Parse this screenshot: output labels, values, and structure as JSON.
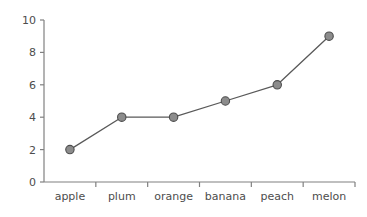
{
  "chart_data": {
    "type": "line",
    "title": "",
    "subtitle": "",
    "xlabel": "",
    "ylabel": "",
    "categories": [
      "apple",
      "plum",
      "orange",
      "banana",
      "peach",
      "melon"
    ],
    "values": [
      2,
      4,
      4,
      5,
      6,
      9
    ],
    "series": [
      {
        "name": "",
        "values": [
          2,
          4,
          4,
          5,
          6,
          9
        ]
      }
    ],
    "ylim": [
      0,
      10
    ],
    "ytick_labels": [
      "0",
      "2",
      "4",
      "6",
      "8",
      "10"
    ],
    "ytick_values": [
      0,
      2,
      4,
      6,
      8,
      10
    ],
    "grid": false,
    "legend": false,
    "legend_position": "none",
    "annotations": [],
    "marker": "circle",
    "colors": {
      "background": "#ffffff",
      "axis": "#808080",
      "line": "#595959",
      "marker_fill": "#8c8c8c",
      "marker_stroke": "#4d4d4d",
      "tick_label": "#4d4d4d"
    }
  }
}
